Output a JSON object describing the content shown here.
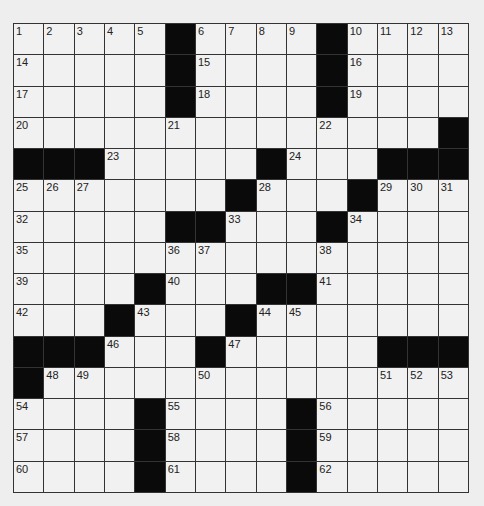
{
  "puzzle": {
    "rows": 15,
    "cols": 15,
    "colors": {
      "background": "#eeeeee",
      "cell": "#f1f1f1",
      "block": "#0a0a0a",
      "line": "#333333"
    },
    "layout": [
      "....#....#....",
      "....#....#....",
      "....#....#....",
      "..............#",
      "###.....#...###",
      ".......#...#...",
      ".....##...#....",
      "...............",
      "....#...##.....",
      "...#...#.......",
      "###...#.....###",
      "#..............",
      "....#....#.....",
      "....#....#.....",
      "....#....#....."
    ],
    "grid": [
      [
        "1",
        "2",
        "3",
        "4",
        "5",
        "#",
        "6",
        "7",
        "8",
        "9",
        "#",
        "10",
        "11",
        "12",
        "13"
      ],
      [
        "14",
        "",
        "",
        "",
        "",
        "#",
        "15",
        "",
        "",
        "",
        "#",
        "16",
        "",
        "",
        ""
      ],
      [
        "17",
        "",
        "",
        "",
        "",
        "#",
        "18",
        "",
        "",
        "",
        "#",
        "19",
        "",
        "",
        ""
      ],
      [
        "20",
        "",
        "",
        "",
        "",
        "21",
        "",
        "",
        "",
        "",
        "22",
        "",
        "",
        "",
        "#"
      ],
      [
        "#",
        "#",
        "#",
        "23",
        "",
        "",
        "",
        "",
        "#",
        "24",
        "",
        "",
        "#",
        "#",
        "#"
      ],
      [
        "25",
        "26",
        "27",
        "",
        "",
        "",
        "",
        "#",
        "28",
        "",
        "",
        "#",
        "29",
        "30",
        "31"
      ],
      [
        "32",
        "",
        "",
        "",
        "",
        "#",
        "#",
        "33",
        "",
        "",
        "#",
        "34",
        "",
        "",
        ""
      ],
      [
        "35",
        "",
        "",
        "",
        "",
        "36",
        "37",
        "",
        "",
        "",
        "38",
        "",
        "",
        "",
        ""
      ],
      [
        "39",
        "",
        "",
        "",
        "#",
        "40",
        "",
        "",
        "#",
        "#",
        "41",
        "",
        "",
        "",
        ""
      ],
      [
        "42",
        "",
        "",
        "#",
        "43",
        "",
        "",
        "#",
        "44",
        "45",
        "",
        "",
        "",
        "",
        ""
      ],
      [
        "#",
        "#",
        "#",
        "46",
        "",
        "",
        "#",
        "47",
        "",
        "",
        "",
        "",
        "#",
        "#",
        "#"
      ],
      [
        "#",
        "48",
        "49",
        "",
        "",
        "",
        "50",
        "",
        "",
        "",
        "",
        "",
        "51",
        "52",
        "53"
      ],
      [
        "54",
        "",
        "",
        "",
        "#",
        "55",
        "",
        "",
        "",
        "#",
        "56",
        "",
        "",
        "",
        ""
      ],
      [
        "57",
        "",
        "",
        "",
        "#",
        "58",
        "",
        "",
        "",
        "#",
        "59",
        "",
        "",
        "",
        ""
      ],
      [
        "60",
        "",
        "",
        "",
        "#",
        "61",
        "",
        "",
        "",
        "#",
        "62",
        "",
        "",
        "",
        ""
      ]
    ]
  }
}
